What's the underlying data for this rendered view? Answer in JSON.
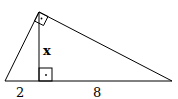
{
  "diagram": {
    "type": "right-triangle-altitude",
    "labels": {
      "altitude": "x",
      "left_segment": "2",
      "right_segment": "8"
    },
    "markers": {
      "apex_right_angle": "right-angle-marker",
      "foot_right_angle": "right-angle-marker"
    },
    "colors": {
      "stroke": "#000000",
      "background": "#ffffff"
    }
  }
}
